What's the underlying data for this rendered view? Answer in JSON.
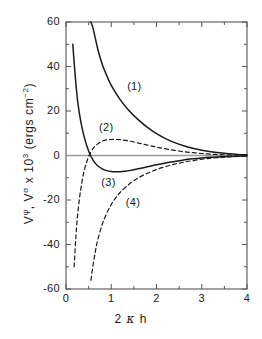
{
  "chart_data": {
    "type": "line",
    "title": "",
    "xlabel": "2 κ h",
    "ylabel": "Vψ, Vσ x 10³ (ergs cm⁻²)",
    "xlim": [
      0,
      4
    ],
    "ylim": [
      -60,
      60
    ],
    "xticks": [
      0,
      1,
      2,
      3,
      4
    ],
    "yticks": [
      60,
      40,
      20,
      0,
      -20,
      -40,
      -60
    ],
    "xtick_labels": [
      "0",
      "1",
      "2",
      "3",
      "4"
    ],
    "ytick_labels": [
      "60",
      "40",
      "20",
      "0",
      "-20",
      "-40",
      "-60"
    ],
    "grid": false,
    "zero_line": true,
    "legend": "inline-annotations",
    "series": [
      {
        "name": "(1)",
        "style": "solid",
        "label_x": 1.55,
        "label_y": 31,
        "x": [
          0.55,
          0.6,
          0.7,
          0.8,
          0.9,
          1.0,
          1.2,
          1.4,
          1.6,
          1.8,
          2.0,
          2.2,
          2.4,
          2.6,
          2.8,
          3.0,
          3.2,
          3.4,
          3.6,
          3.8,
          4.0
        ],
        "y": [
          60,
          57,
          48,
          41,
          36,
          31.5,
          25,
          20,
          16,
          12.6,
          9.8,
          7.6,
          5.8,
          4.4,
          3.3,
          2.4,
          1.7,
          1.2,
          0.8,
          0.5,
          0.3
        ]
      },
      {
        "name": "(2)",
        "style": "dashed",
        "label_x": 0.93,
        "label_y": 12.5,
        "x": [
          0.18,
          0.22,
          0.26,
          0.32,
          0.4,
          0.5,
          0.6,
          0.7,
          0.8,
          0.9,
          1.0,
          1.1,
          1.2,
          1.4,
          1.6,
          1.8,
          2.0,
          2.2,
          2.4,
          2.6,
          2.8,
          3.0,
          3.2,
          3.4,
          3.6,
          3.8,
          4.0
        ],
        "y": [
          -50,
          -36,
          -26,
          -16,
          -7,
          -0.5,
          3.2,
          5.2,
          6.4,
          7.0,
          7.2,
          7.2,
          7.1,
          6.5,
          5.6,
          4.7,
          3.8,
          3.0,
          2.3,
          1.7,
          1.3,
          0.9,
          0.6,
          0.4,
          0.3,
          0.2,
          0.1
        ]
      },
      {
        "name": "(3)",
        "style": "solid",
        "label_x": 0.98,
        "label_y": -12.5,
        "x": [
          0.15,
          0.18,
          0.22,
          0.26,
          0.32,
          0.4,
          0.5,
          0.6,
          0.7,
          0.8,
          0.9,
          1.0,
          1.1,
          1.2,
          1.3,
          1.4,
          1.6,
          1.8,
          2.0,
          2.2,
          2.4,
          2.6,
          2.8,
          3.0,
          3.2,
          3.4,
          3.6,
          3.8,
          4.0
        ],
        "y": [
          50,
          42,
          32,
          24,
          16,
          8.5,
          2.0,
          -2.2,
          -4.6,
          -6.0,
          -6.8,
          -7.2,
          -7.3,
          -7.3,
          -7.1,
          -6.8,
          -6.0,
          -5.1,
          -4.2,
          -3.4,
          -2.7,
          -2.0,
          -1.5,
          -1.1,
          -0.8,
          -0.6,
          -0.4,
          -0.3,
          -0.2
        ]
      },
      {
        "name": "(4)",
        "style": "dashed",
        "label_x": 1.52,
        "label_y": -21.5,
        "x": [
          0.55,
          0.6,
          0.65,
          0.7,
          0.8,
          0.9,
          1.0,
          1.1,
          1.2,
          1.4,
          1.6,
          1.8,
          2.0,
          2.2,
          2.4,
          2.6,
          2.8,
          3.0,
          3.2,
          3.4,
          3.6,
          3.8,
          4.0
        ],
        "y": [
          -56,
          -49,
          -43,
          -38,
          -31,
          -26,
          -22,
          -19,
          -16.5,
          -12.8,
          -10.0,
          -8.0,
          -6.3,
          -5.0,
          -3.9,
          -3.0,
          -2.3,
          -1.7,
          -1.2,
          -0.9,
          -0.6,
          -0.4,
          -0.2
        ]
      }
    ]
  },
  "axis": {
    "y_title_parts": {
      "v1": "V",
      "psi": "ψ",
      "comma": ", ",
      "v2": "V",
      "sigma": "σ",
      "times": " x 10",
      "exp3": "3",
      "units": " (ergs  cm",
      "exp_units": "−2",
      "close": ")"
    },
    "x_title_parts": {
      "two": "2",
      "kappa": "κ",
      "h": "h"
    }
  },
  "colors": {
    "curve": "#1a1a1a",
    "zero_line": "#9a9a9a",
    "axis": "#555555",
    "background": "#ffffff"
  }
}
